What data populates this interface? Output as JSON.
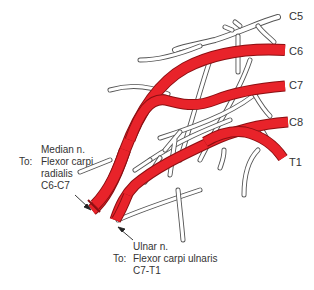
{
  "diagram": {
    "type": "anatomical-illustration",
    "colors": {
      "highlight_nerve": "#e8232a",
      "highlight_edge": "#8b0f12",
      "other_nerve_fill": "#ffffff",
      "other_nerve_outline": "#555555",
      "text": "#333333"
    },
    "root_labels": [
      {
        "id": "c5",
        "label": "C5",
        "highlighted": false
      },
      {
        "id": "c6",
        "label": "C6",
        "highlighted": true
      },
      {
        "id": "c7",
        "label": "C7",
        "highlighted": true
      },
      {
        "id": "c8",
        "label": "C8",
        "highlighted": true
      },
      {
        "id": "t1",
        "label": "T1",
        "highlighted": true
      }
    ],
    "callouts": {
      "median": {
        "nerve": "Median n.",
        "to_prefix": "To:",
        "muscle_line1": "Flexor carpi",
        "muscle_line2": "radialis",
        "roots": "C6-C7"
      },
      "ulnar": {
        "nerve": "Ulnar n.",
        "to_prefix": "To:",
        "muscle": "Flexor carpi ulnaris",
        "roots": "C7-T1"
      }
    }
  }
}
